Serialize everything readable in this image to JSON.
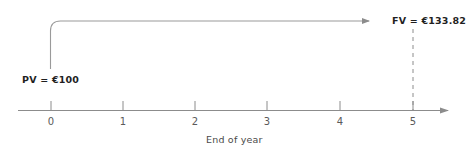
{
  "diagram": {
    "type": "timeline-cash-flow",
    "caption": "End of year",
    "present_value": {
      "label": "PV = €100",
      "amount": 100,
      "currency": "€",
      "period": 0
    },
    "future_value": {
      "label": "FV = €133.82",
      "amount": 133.82,
      "currency": "€",
      "period": 5
    },
    "axis": {
      "ticks": [
        {
          "label": "0",
          "value": 0
        },
        {
          "label": "1",
          "value": 1
        },
        {
          "label": "2",
          "value": 2
        },
        {
          "label": "3",
          "value": 3
        },
        {
          "label": "4",
          "value": 4
        },
        {
          "label": "5",
          "value": 5
        }
      ],
      "arrow": "right-arrow-icon"
    },
    "growth_arrow": {
      "name": "compounding-arrow-icon",
      "from_period": 0,
      "to_period": 5
    },
    "dashed_connector": {
      "name": "dashed-guide-line",
      "at_period": 5
    },
    "colors": {
      "line": "#8c8c8c",
      "text": "#2a2a2a",
      "tick_text": "#5a5a5a",
      "background": "#ffffff"
    }
  }
}
